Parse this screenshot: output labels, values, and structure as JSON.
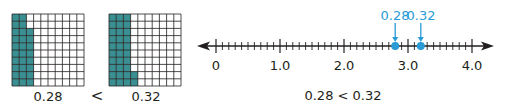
{
  "colors": {
    "grid_fill": "#3a8f92",
    "grid_line": "#231f20",
    "highlight": "#2a9bd6",
    "axis": "#231f20"
  },
  "grids": [
    {
      "label": "0.28",
      "shaded": 28,
      "size": 10
    },
    {
      "label": "0.32",
      "shaded": 32,
      "size": 10
    }
  ],
  "grid_comparison_symbol": "<",
  "number_line": {
    "min": 0,
    "max": 4,
    "minor_divisions": 10,
    "tick_labels": [
      "0",
      "1.0",
      "2.0",
      "3.0",
      "4.0"
    ],
    "points": [
      {
        "label": "0.28",
        "position": 2.8
      },
      {
        "label": "0.32",
        "position": 3.2
      }
    ]
  },
  "number_line_comparison": "0.28 < 0.32"
}
